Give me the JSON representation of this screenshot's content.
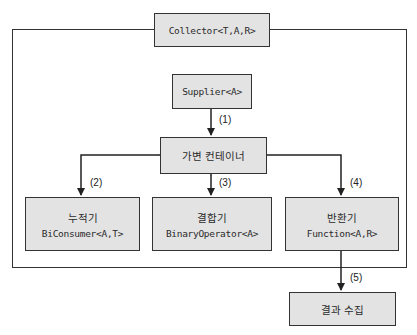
{
  "diagram": {
    "collector": {
      "label": "Collector<T,A,R>"
    },
    "supplier": {
      "label": "Supplier<A>"
    },
    "container": {
      "label": "가변 컨테이너"
    },
    "accumulator": {
      "title": "누적기",
      "type": "BiConsumer<A,T>"
    },
    "combiner": {
      "title": "결합기",
      "type": "BinaryOperator<A>"
    },
    "finisher": {
      "title": "반환기",
      "type": "Function<A,R>"
    },
    "result": {
      "label": "결과 수집"
    },
    "steps": [
      "(1)",
      "(2)",
      "(3)",
      "(4)",
      "(5)"
    ],
    "colors": {
      "box_fill": "#e3e3e3",
      "stroke": "#333333",
      "background": "#ffffff"
    }
  }
}
